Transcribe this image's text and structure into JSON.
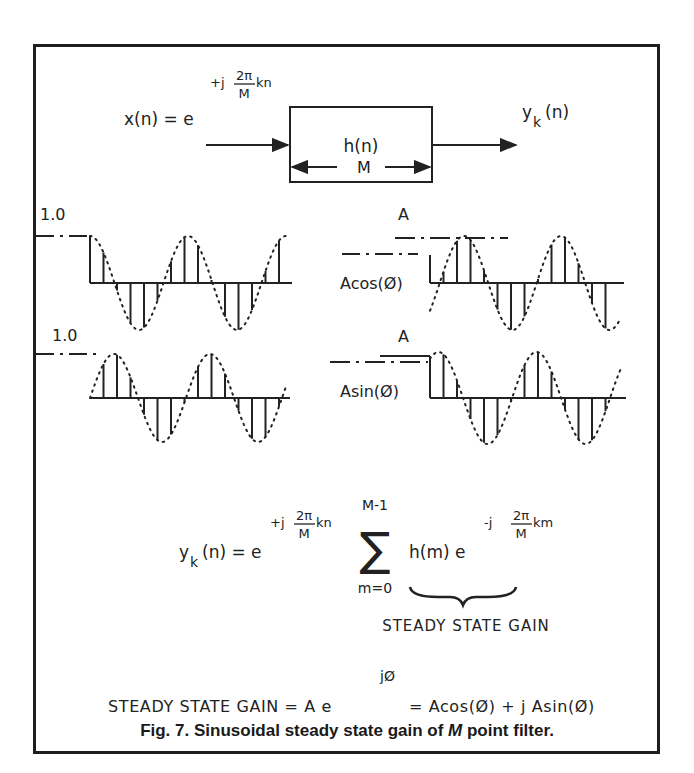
{
  "figure": {
    "input_label": "x(n) = e",
    "input_exponent": {
      "prefix": "+j",
      "num": "2π",
      "den": "M",
      "suffix": "kn"
    },
    "filter_label": "h(n)",
    "output_label": {
      "base": "y",
      "sub": "k",
      "arg": "(n)"
    },
    "length_label": "M"
  },
  "waveforms": {
    "top_left": {
      "level_label": "1.0",
      "type": "cosine"
    },
    "top_right": {
      "level_label": "A",
      "axis_label": "Acos(Ø)",
      "type": "shifted-cosine"
    },
    "bottom_left": {
      "level_label": "1.0",
      "type": "sine"
    },
    "bottom_right": {
      "level_label": "A",
      "axis_label": "Asin(Ø)",
      "type": "shifted-sine"
    }
  },
  "equation": {
    "lhs": {
      "base": "y",
      "sub": "k",
      "arg": "(n) = e"
    },
    "exp1": {
      "prefix": "+j",
      "num": "2π",
      "den": "M",
      "suffix": "kn"
    },
    "sum_upper": "M-1",
    "sum_lower": "m=0",
    "term": "h(m)  e",
    "exp2": {
      "prefix": "-j",
      "num": "2π",
      "den": "M",
      "suffix": "km"
    },
    "brace_label": "STEADY STATE GAIN"
  },
  "gain_equation": {
    "lhs": "STEADY STATE GAIN = A e",
    "exponent": "jØ",
    "rhs": "= Acos(Ø) + j Asin(Ø)"
  },
  "caption": {
    "prefix": "Fig. 7.   Sinusoidal steady state gain of ",
    "italic": "M",
    "suffix": " point filter."
  }
}
